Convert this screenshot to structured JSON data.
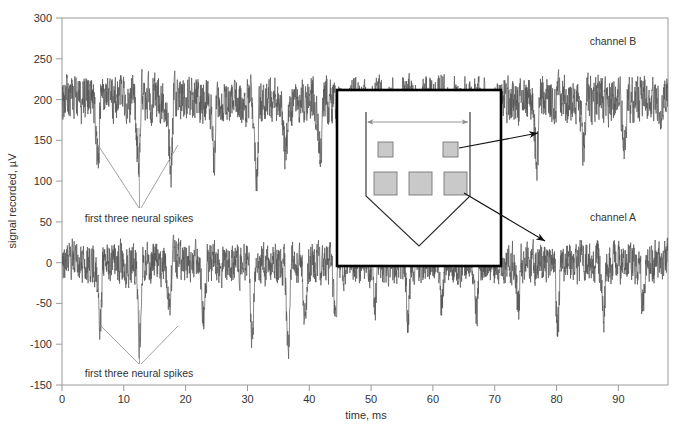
{
  "chart_data": {
    "type": "line",
    "title": "",
    "xlabel": "time, ms",
    "ylabel": "signal recorded, µV",
    "xlim": [
      0,
      98
    ],
    "ylim": [
      -150,
      300
    ],
    "xticks": [
      0,
      10,
      20,
      30,
      40,
      50,
      60,
      70,
      80,
      90
    ],
    "yticks": [
      -150,
      -100,
      -50,
      0,
      50,
      100,
      150,
      200,
      250,
      300
    ],
    "xtick_labels": [
      "0",
      "10",
      "20",
      "30",
      "40",
      "50",
      "60",
      "70",
      "80",
      "90"
    ],
    "ytick_labels": [
      "-150",
      "-100",
      "-50",
      "0",
      "50",
      "100",
      "150",
      "200",
      "250",
      "300"
    ],
    "grid": false,
    "legend_position": "inline-right",
    "series": [
      {
        "name": "channel B",
        "baseline": 200,
        "noise_amplitude": 22,
        "color": "#555555",
        "spike_times": [
          5.8,
          12.4,
          17.6,
          24.6,
          31.5,
          36.2,
          41.8,
          46.0,
          52.4,
          57.8,
          63.0,
          69.5,
          76.8,
          84.4,
          91.0
        ],
        "spike_depths": [
          78,
          86,
          80,
          72,
          92,
          70,
          66,
          74,
          60,
          64,
          58,
          70,
          80,
          62,
          56
        ]
      },
      {
        "name": "channel A",
        "baseline": 0,
        "noise_amplitude": 20,
        "color": "#555555",
        "spike_times": [
          6.2,
          12.6,
          17.4,
          23.0,
          30.8,
          36.6,
          39.4,
          44.2,
          50.6,
          56.0,
          61.4,
          67.0,
          73.8,
          80.2,
          87.6,
          94.0
        ],
        "spike_depths": [
          74,
          96,
          72,
          66,
          84,
          100,
          70,
          62,
          58,
          66,
          60,
          64,
          56,
          70,
          62,
          54
        ]
      }
    ],
    "annotations": [
      {
        "text": "first three neural spikes",
        "series": "channel B",
        "x": 12.5,
        "y": 73
      },
      {
        "text": "first three neural spikes",
        "series": "channel A",
        "x": 12.5,
        "y": -128
      },
      {
        "text": "channel B",
        "x": 86,
        "y": 272
      },
      {
        "text": "channel A",
        "x": 86,
        "y": 62
      }
    ]
  },
  "axes": {
    "ylabel": "signal recorded, µV",
    "xlabel": "time, ms",
    "xtick_labels": [
      "0",
      "10",
      "20",
      "30",
      "40",
      "50",
      "60",
      "70",
      "80",
      "90"
    ],
    "ytick_labels": [
      "300",
      "250",
      "200",
      "150",
      "100",
      "50",
      "0",
      "-50",
      "-100",
      "-150"
    ]
  },
  "channel_labels": {
    "upper": "channel B",
    "lower": "channel A"
  },
  "spike_annotations": {
    "upper": "first three neural spikes",
    "lower": "first three neural spikes"
  },
  "inset": {
    "name": "electrode-array-diagram",
    "border_color": "#000000",
    "pad_fill": "#c9c9c9",
    "pad_stroke": "#777777",
    "small_pads": 2,
    "large_pads": 3
  },
  "colors": {
    "trace": "#555555",
    "axis": "#999999",
    "text": "#333333",
    "inset_border": "#000000",
    "pad": "#c9c9c9"
  }
}
